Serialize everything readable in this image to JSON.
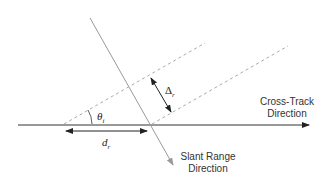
{
  "diagram": {
    "labels": {
      "cross_track_line1": "Cross-Track",
      "cross_track_line2": "Direction",
      "slant_range_line1": "Slant Range",
      "slant_range_line2": "Direction",
      "theta_symbol": "θ",
      "theta_sub": "i",
      "delta_symbol": "Δ",
      "delta_sub": "r",
      "d_symbol": "d",
      "d_sub": "r"
    },
    "colors": {
      "axis": "#333333",
      "slant": "#999999",
      "dashed": "#aaaaaa",
      "arrow": "#222222"
    }
  }
}
